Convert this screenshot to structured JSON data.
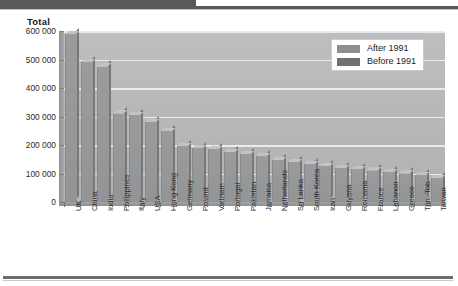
{
  "chart_data": {
    "type": "bar",
    "title": "",
    "ylabel": "Total",
    "xlabel": "",
    "ylim": [
      0,
      600000
    ],
    "ytick_labels": [
      "600 000",
      "500 000",
      "400 000",
      "300 000",
      "200 000",
      "100 000",
      "0"
    ],
    "ytick_values": [
      600000,
      500000,
      400000,
      300000,
      200000,
      100000,
      0
    ],
    "grid": true,
    "legend_position": "top-right",
    "legend": [
      {
        "label": "After 1991",
        "color": "#8e8f91"
      },
      {
        "label": "Before 1991",
        "color": "#6f7072"
      }
    ],
    "categories": [
      "UK",
      "China",
      "India",
      "Philippines",
      "Italy",
      "USA",
      "Hong Kong",
      "Germany",
      "Poland",
      "Vietnam",
      "Portugal",
      "Pakistan",
      "Jamaica",
      "Netherlands",
      "Sri Lanka",
      "South Korea",
      "Iran",
      "Guyana",
      "Romania",
      "France",
      "Lebanon",
      "Greece",
      "Trin. Tob.",
      "Taiwan"
    ],
    "values": [
      590000,
      490000,
      475000,
      310000,
      305000,
      280000,
      250000,
      195000,
      190000,
      185000,
      175000,
      168000,
      160000,
      148000,
      140000,
      132000,
      125000,
      120000,
      115000,
      110000,
      105000,
      100000,
      95000,
      85000
    ],
    "bar_color": "#9a9b9d",
    "plot_background": "#b9babc",
    "gridline_color": "#e9eaec"
  }
}
